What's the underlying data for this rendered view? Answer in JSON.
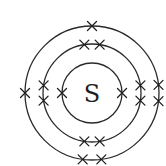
{
  "diagram": {
    "title_fragment": "",
    "element_symbol": "S",
    "center": [
      92,
      93
    ],
    "colors": {
      "stroke": "#2a2a2a",
      "background": "#ffffff"
    },
    "shells": [
      {
        "name": "inner",
        "radius": 30,
        "electron_count": 2,
        "electrons_deg": [
          180,
          0
        ]
      },
      {
        "name": "middle",
        "radius": 49,
        "electron_count": 8,
        "electrons_deg": [
          -99,
          -81,
          99,
          81,
          171,
          189,
          -9,
          9
        ]
      },
      {
        "name": "outer",
        "radius": 67,
        "electron_count": 6,
        "electrons_deg": [
          -90,
          98,
          82,
          180,
          -7,
          7
        ]
      }
    ],
    "electron_marker": "cross-icon",
    "configuration": "2,8,6"
  }
}
